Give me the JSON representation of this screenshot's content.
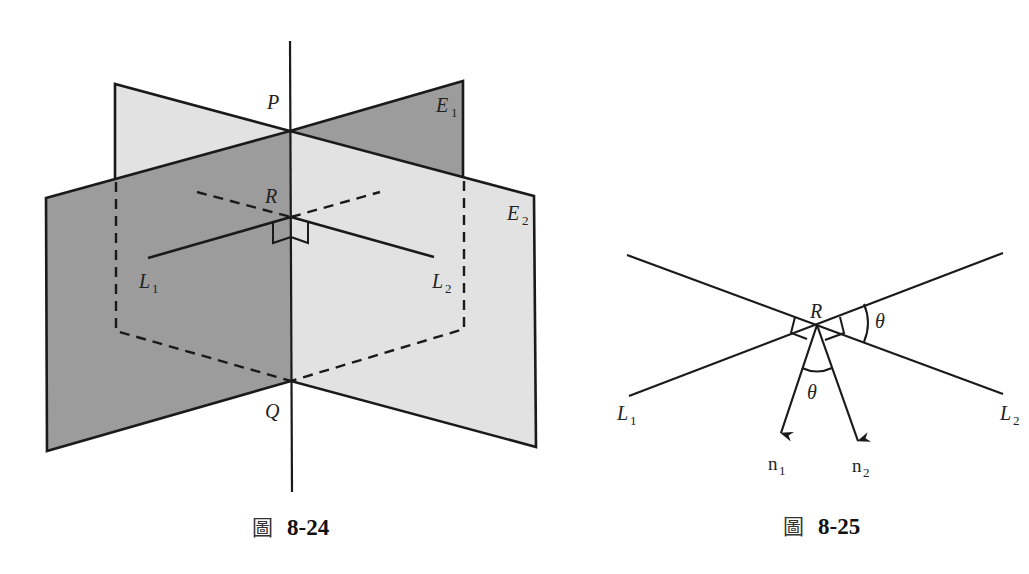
{
  "colors": {
    "dark_plane": "#9c9c9c",
    "light_plane": "#e2e2e2",
    "line": "#1a1a1a"
  },
  "figure_1": {
    "caption_prefix": "圖",
    "caption_number": "8-24",
    "labels": {
      "P": "P",
      "Q": "Q",
      "R": "R",
      "E1": "E",
      "E1_sub": "1",
      "E2": "E",
      "E2_sub": "2",
      "L1": "L",
      "L1_sub": "1",
      "L2": "L",
      "L2_sub": "2"
    }
  },
  "figure_2": {
    "caption_prefix": "圖",
    "caption_number": "8-25",
    "labels": {
      "R": "R",
      "theta_right": "θ",
      "theta_bottom": "θ",
      "L1": "L",
      "L1_sub": "1",
      "L2": "L",
      "L2_sub": "2",
      "n1": "n",
      "n1_sub": "1",
      "n2": "n",
      "n2_sub": "2"
    }
  }
}
